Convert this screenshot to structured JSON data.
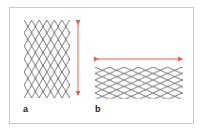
{
  "figure": {
    "panels": [
      {
        "label": "a",
        "orientation": "vertical",
        "description": "diamond mesh stretched vertically"
      },
      {
        "label": "b",
        "orientation": "horizontal",
        "description": "diamond mesh stretched horizontally"
      }
    ],
    "colors": {
      "mesh": "#3a3a3a",
      "arrow": "#e8604a",
      "border": "#c8c8c8"
    }
  }
}
